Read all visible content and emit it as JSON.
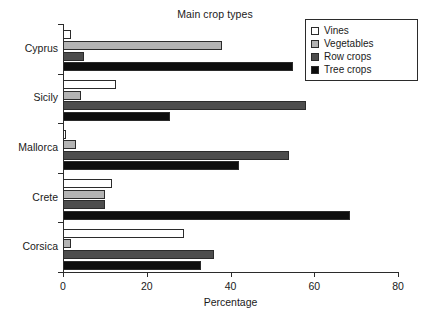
{
  "chart_data": {
    "type": "bar",
    "orientation": "horizontal",
    "title": "Main crop types",
    "xlabel": "Percentage",
    "ylabel": "",
    "xlim": [
      0,
      80
    ],
    "xticks": [
      0,
      20,
      40,
      60,
      80
    ],
    "xtick_labels": [
      "0",
      "20",
      "40",
      "60",
      "80"
    ],
    "grid": false,
    "legend_position": "top-right",
    "categories": [
      "Cyprus",
      "Sicily",
      "Mallorca",
      "Crete",
      "Corsica"
    ],
    "series": [
      {
        "name": "Vines",
        "color": "#ffffff",
        "values": [
          2.0,
          12.7,
          0.8,
          11.8,
          29.0
        ]
      },
      {
        "name": "Vegetables",
        "color": "#b3b3b3",
        "values": [
          38.0,
          4.3,
          3.2,
          10.0,
          2.0
        ]
      },
      {
        "name": "Row crops",
        "color": "#4d4d4d",
        "values": [
          5.0,
          58.0,
          54.0,
          10.0,
          36.0
        ]
      },
      {
        "name": "Tree crops",
        "color": "#0d0d0d",
        "values": [
          55.0,
          25.5,
          42.0,
          68.5,
          33.0
        ]
      }
    ],
    "legend": [
      {
        "label": "Vines",
        "color": "#ffffff"
      },
      {
        "label": "Vegetables",
        "color": "#b3b3b3"
      },
      {
        "label": "Row crops",
        "color": "#4d4d4d"
      },
      {
        "label": "Tree crops",
        "color": "#0d0d0d"
      }
    ]
  }
}
